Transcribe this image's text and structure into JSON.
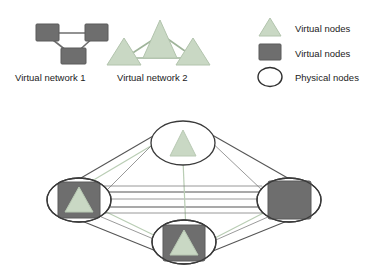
{
  "figure": {
    "background": "#ffffff",
    "colors": {
      "virtual_triangle_fill": "#c9d8c4",
      "virtual_triangle_stroke": "#b2c4ad",
      "virtual_square_fill": "#6e6e6e",
      "virtual_square_stroke": "#5b5b5b",
      "physical_node_fill": "#ffffff",
      "physical_node_stroke": "#3a3a3a",
      "physical_link": "#555555",
      "virtual_link_green": "#b9cdb4",
      "virtual_link_gray": "#8f8f8f",
      "text": "#1b1b1b"
    }
  },
  "virtual_networks": [
    {
      "id": "virtual-network-1",
      "caption": "Virtual network 1",
      "node_shape": "square",
      "node_count": 3,
      "nodes": [
        {
          "id": "vn1-n1",
          "x": 48,
          "y": 33
        },
        {
          "id": "vn1-n2",
          "x": 95,
          "y": 33
        },
        {
          "id": "vn1-n3",
          "x": 72,
          "y": 55
        }
      ],
      "links": [
        {
          "from": "vn1-n1",
          "to": "vn1-n2"
        },
        {
          "from": "vn1-n1",
          "to": "vn1-n3"
        },
        {
          "from": "vn1-n2",
          "to": "vn1-n3"
        }
      ]
    },
    {
      "id": "virtual-network-2",
      "caption": "Virtual network 2",
      "node_shape": "triangle",
      "node_count": 3,
      "nodes": [
        {
          "id": "vn2-n1",
          "x": 160,
          "y": 28
        },
        {
          "id": "vn2-n2",
          "x": 124,
          "y": 55
        },
        {
          "id": "vn2-n3",
          "x": 193,
          "y": 55
        }
      ],
      "links": [
        {
          "from": "vn2-n1",
          "to": "vn2-n2"
        },
        {
          "from": "vn2-n1",
          "to": "vn2-n3"
        },
        {
          "from": "vn2-n2",
          "to": "vn2-n3"
        }
      ]
    }
  ],
  "legend": {
    "items": [
      {
        "id": "legend-triangle",
        "glyph": "triangle-icon",
        "label": "Virtual nodes"
      },
      {
        "id": "legend-square",
        "glyph": "square-icon",
        "label": "Virtual nodes"
      },
      {
        "id": "legend-ellipse",
        "glyph": "ellipse-icon",
        "label": "Physical nodes"
      }
    ]
  },
  "physical_network": {
    "id": "physical-substrate",
    "nodes": [
      {
        "id": "pn-top",
        "label": "",
        "cx": 183,
        "cy": 143,
        "rx": 32,
        "ry": 22,
        "contains": [
          "triangle"
        ]
      },
      {
        "id": "pn-left",
        "label": "",
        "cx": 79,
        "cy": 200,
        "rx": 32,
        "ry": 22,
        "contains": [
          "square",
          "triangle"
        ]
      },
      {
        "id": "pn-right",
        "label": "",
        "cx": 289,
        "cy": 200,
        "rx": 32,
        "ry": 22,
        "contains": [
          "square"
        ]
      },
      {
        "id": "pn-bottom",
        "label": "",
        "cx": 184,
        "cy": 242,
        "rx": 32,
        "ry": 22,
        "contains": [
          "square",
          "triangle"
        ]
      }
    ],
    "physical_links": [
      {
        "from": "pn-top",
        "to": "pn-left"
      },
      {
        "from": "pn-top",
        "to": "pn-right"
      },
      {
        "from": "pn-left",
        "to": "pn-bottom"
      },
      {
        "from": "pn-right",
        "to": "pn-bottom"
      },
      {
        "from": "pn-left",
        "to": "pn-right"
      }
    ],
    "virtual_overlay_links": [
      {
        "network": "virtual-network-1",
        "from": "pn-left",
        "to": "pn-right"
      },
      {
        "network": "virtual-network-1",
        "from": "pn-left",
        "to": "pn-bottom"
      },
      {
        "network": "virtual-network-1",
        "from": "pn-right",
        "to": "pn-bottom"
      },
      {
        "network": "virtual-network-2",
        "from": "pn-top",
        "to": "pn-left"
      },
      {
        "network": "virtual-network-2",
        "from": "pn-top",
        "to": "pn-bottom"
      },
      {
        "network": "virtual-network-2",
        "from": "pn-left",
        "to": "pn-bottom"
      }
    ]
  }
}
